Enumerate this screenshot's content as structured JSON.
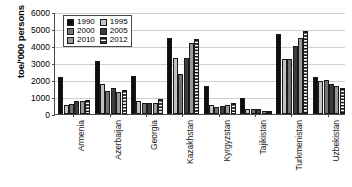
{
  "chart_data": {
    "type": "bar",
    "title": "",
    "xlabel": "",
    "ylabel": "toe/'000 persons",
    "ylim": [
      0,
      6000
    ],
    "ytick_labels": [
      "6000",
      "5000",
      "4000",
      "3000",
      "2000",
      "1000",
      "0"
    ],
    "ytick_values": [
      6000,
      5000,
      4000,
      3000,
      2000,
      1000,
      0
    ],
    "grid": true,
    "legend_position": "upper-left-inside",
    "categories": [
      "Armenia",
      "Azerbaijan",
      "Georgia",
      "Kazakhstan",
      "Kyrgyzstan",
      "Tajikistan",
      "Turkmenistan",
      "Uzbekistan"
    ],
    "series": [
      {
        "name": "1990",
        "color": "#0d0d0d",
        "values": [
          2180,
          3130,
          2240,
          4460,
          1650,
          950,
          4710,
          2200
        ]
      },
      {
        "name": "1995",
        "color": "#c2c2c2",
        "values": [
          510,
          1770,
          740,
          3270,
          520,
          310,
          3240,
          1950
        ]
      },
      {
        "name": "2000",
        "color": "#737373",
        "values": [
          600,
          1370,
          620,
          2340,
          440,
          290,
          3250,
          1990
        ]
      },
      {
        "name": "2005",
        "color": "#3d3d3d",
        "values": [
          760,
          1540,
          640,
          3320,
          450,
          280,
          3990,
          1740
        ]
      },
      {
        "name": "2010",
        "color": "#9a9a9a",
        "values": [
          740,
          1290,
          670,
          4200,
          520,
          200,
          4460,
          1650
        ]
      },
      {
        "name": "2012",
        "color": "#ffffff",
        "values": [
          830,
          1400,
          900,
          4420,
          660,
          190,
          4900,
          1550
        ]
      }
    ]
  },
  "legend": {
    "entries": [
      {
        "label": "1990"
      },
      {
        "label": "1995"
      },
      {
        "label": "2000"
      },
      {
        "label": "2005"
      },
      {
        "label": "2010"
      },
      {
        "label": "2012"
      }
    ]
  }
}
